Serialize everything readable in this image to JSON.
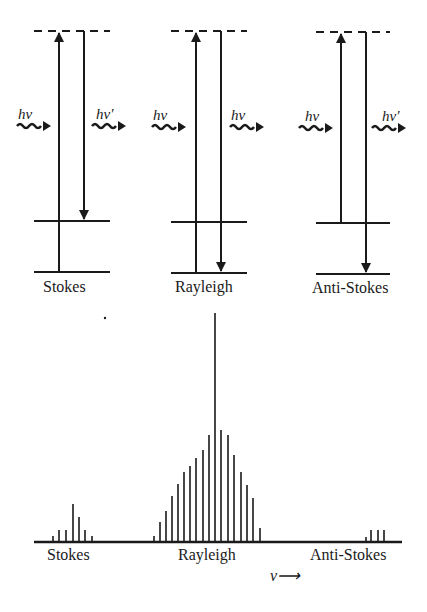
{
  "diagrams": [
    {
      "name": "stokes",
      "label": "Stokes",
      "incident": "hν",
      "scattered": "hν′"
    },
    {
      "name": "rayleigh",
      "label": "Rayleigh",
      "incident": "hν",
      "scattered": "hν"
    },
    {
      "name": "anti-stokes",
      "label": "Anti-Stokes",
      "incident": "hν",
      "scattered": "hν′"
    }
  ],
  "spectrum": {
    "labels": {
      "stokes": "Stokes",
      "rayleigh": "Rayleigh",
      "anti_stokes": "Anti-Stokes"
    },
    "axis_label": "ν⟶"
  },
  "chart_data": {
    "type": "bar",
    "xlabel": "ν⟶",
    "ylabel": "",
    "regions": [
      "Stokes",
      "Rayleigh",
      "Anti-Stokes"
    ],
    "series": [
      {
        "name": "Stokes",
        "x": [
          53,
          59,
          66,
          73,
          79,
          85,
          92
        ],
        "values": [
          5,
          11,
          11,
          37,
          24,
          11,
          5
        ]
      },
      {
        "name": "Rayleigh",
        "x": [
          154,
          160,
          166,
          172,
          178,
          184,
          190,
          196,
          203,
          209,
          215,
          221,
          228,
          234,
          241,
          247,
          253,
          260
        ],
        "values": [
          5,
          19,
          30,
          45,
          57,
          69,
          75,
          83,
          91,
          106,
          228,
          111,
          106,
          86,
          69,
          56,
          43,
          13
        ]
      },
      {
        "name": "Anti-Stokes",
        "x": [
          366,
          371,
          378,
          384
        ],
        "values": [
          4,
          11,
          11,
          11
        ]
      }
    ],
    "grid": false,
    "legend": "none"
  }
}
